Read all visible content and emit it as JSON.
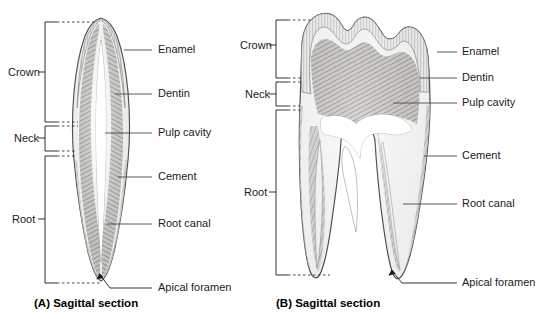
{
  "figure": {
    "background_color": "#ffffff",
    "ink_color": "#1a1a1a"
  },
  "panels": [
    {
      "id": "A",
      "caption": "(A) Sagittal section",
      "tooth_type": "incisor",
      "brackets": [
        {
          "label": "Crown",
          "top": 22,
          "bottom": 122
        },
        {
          "label": "Neck",
          "top": 126,
          "bottom": 151
        },
        {
          "label": "Root",
          "top": 156,
          "bottom": 283
        }
      ],
      "labels": [
        {
          "text": "Enamel",
          "y": 50,
          "leader_from_x": 124,
          "leader_to_x": 152,
          "target_x": 104,
          "target_y": 50
        },
        {
          "text": "Dentin",
          "y": 94,
          "leader_from_x": 115,
          "leader_to_x": 152,
          "target_x": 104,
          "target_y": 94
        },
        {
          "text": "Pulp cavity",
          "y": 133,
          "leader_from_x": 105,
          "leader_to_x": 152,
          "target_x": 100,
          "target_y": 133
        },
        {
          "text": "Cement",
          "y": 177,
          "leader_from_x": 118,
          "leader_to_x": 152,
          "target_x": 108,
          "target_y": 177
        },
        {
          "text": "Root canal",
          "y": 224,
          "leader_from_x": 107,
          "leader_to_x": 152,
          "target_x": 104,
          "target_y": 224
        },
        {
          "text": "Apical foramen",
          "y": 288,
          "leader_from_x": 100,
          "leader_to_x": 152,
          "target_x": 100,
          "target_y": 274
        }
      ]
    },
    {
      "id": "B",
      "caption": "(B) Sagittal section",
      "tooth_type": "molar",
      "brackets": [
        {
          "label": "Crown",
          "top": 20,
          "bottom": 78
        },
        {
          "label": "Neck",
          "top": 82,
          "bottom": 106
        },
        {
          "label": "Root",
          "top": 110,
          "bottom": 275
        }
      ],
      "labels": [
        {
          "text": "Enamel",
          "y": 52,
          "leader_from_x": 437,
          "leader_to_x": 457,
          "target_x": 432,
          "target_y": 52
        },
        {
          "text": "Dentin",
          "y": 78,
          "leader_from_x": 420,
          "leader_to_x": 457,
          "target_x": 412,
          "target_y": 78
        },
        {
          "text": "Pulp cavity",
          "y": 103,
          "leader_from_x": 393,
          "leader_to_x": 457,
          "target_x": 388,
          "target_y": 103
        },
        {
          "text": "Cement",
          "y": 156,
          "leader_from_x": 424,
          "leader_to_x": 457,
          "target_x": 420,
          "target_y": 156
        },
        {
          "text": "Root canal",
          "y": 204,
          "leader_from_x": 403,
          "leader_to_x": 457,
          "target_x": 398,
          "target_y": 204
        },
        {
          "text": "Apical foramen",
          "y": 283,
          "leader_from_x": 392,
          "leader_to_x": 457,
          "target_x": 392,
          "target_y": 270
        }
      ]
    }
  ],
  "label_columns": {
    "panel_a_label_x": 158,
    "panel_b_label_x": 462
  },
  "bracket_label_x": {
    "panel_a": 8,
    "panel_b": 240
  }
}
